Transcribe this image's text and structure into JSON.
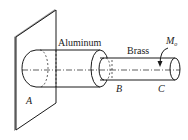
{
  "diagram": {
    "labels": {
      "aluminum": "Aluminum",
      "brass": "Brass",
      "point_a": "A",
      "point_b": "B",
      "point_c": "C",
      "moment": "M",
      "moment_sub": "o"
    },
    "colors": {
      "stroke": "#1a1a1a",
      "wall_shade": "#9a9a9a",
      "background": "#ffffff"
    }
  }
}
